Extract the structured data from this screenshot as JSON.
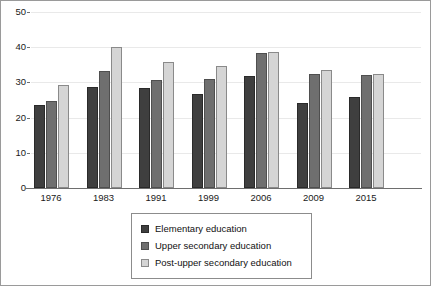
{
  "chart_data": {
    "type": "bar",
    "title": "",
    "subtitle": "",
    "xlabel": "",
    "ylabel": "",
    "categories": [
      "1976",
      "1983",
      "1991",
      "1999",
      "2006",
      "2009",
      "2015"
    ],
    "series": [
      {
        "name": "Elementary education",
        "color": "#3f3f3f",
        "values": [
          23.5,
          28.8,
          28.4,
          26.6,
          31.7,
          24.2,
          25.9
        ]
      },
      {
        "name": "Upper secondary education",
        "color": "#6f6f6f",
        "values": [
          24.7,
          33.3,
          30.8,
          31.1,
          38.3,
          32.3,
          32.0
        ]
      },
      {
        "name": "Post-upper secondary education",
        "color": "#d5d5d5",
        "values": [
          29.2,
          40.0,
          35.7,
          34.8,
          38.6,
          33.4,
          32.5
        ]
      }
    ],
    "ylim": [
      0,
      50
    ],
    "y_ticks": [
      0,
      10,
      20,
      30,
      40,
      50
    ],
    "y_tick_labels": [
      "0",
      "10",
      "20",
      "30",
      "40",
      "50"
    ],
    "grid": true,
    "legend_position": "bottom-center",
    "frame_border_color": "#9a9a9a",
    "gridline_color": "#e9e9e9",
    "axis_color": "#6e6e6e"
  }
}
